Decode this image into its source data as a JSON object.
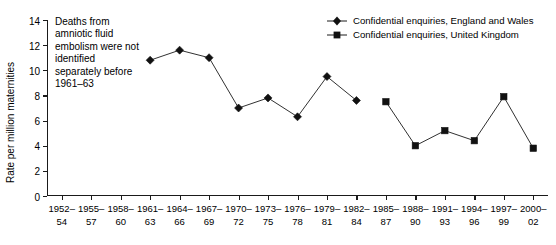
{
  "chart_data": {
    "type": "line",
    "title": "",
    "xlabel": "",
    "ylabel": "Rate per million maternities",
    "ylim": [
      0,
      14
    ],
    "ytick_step": 2,
    "grid": false,
    "legend_position": "top-right",
    "categories": [
      "1952–54",
      "1955–57",
      "1958–60",
      "1961–63",
      "1964–66",
      "1967–69",
      "1970–72",
      "1973–75",
      "1976–78",
      "1979–81",
      "1982–84",
      "1985–87",
      "1988–90",
      "1991–93",
      "1994–96",
      "1997–99",
      "2000–02"
    ],
    "yticks": [
      "0",
      "2",
      "4",
      "6",
      "8",
      "10",
      "12",
      "14"
    ],
    "series": [
      {
        "name": "Confidential enquiries, England and Wales",
        "marker": "diamond",
        "values": [
          null,
          null,
          null,
          10.8,
          11.6,
          11.0,
          7.0,
          7.8,
          6.3,
          9.5,
          7.6,
          null,
          null,
          null,
          null,
          null,
          null
        ]
      },
      {
        "name": "Confidential enquiries, United Kingdom",
        "marker": "square",
        "values": [
          null,
          null,
          null,
          null,
          null,
          null,
          null,
          null,
          null,
          null,
          null,
          7.5,
          4.0,
          5.2,
          4.4,
          7.9,
          3.8
        ]
      }
    ],
    "annotations": [
      {
        "text": "Deaths from\namniotic fluid\nembolism were not\nidentified\nseparately before\n1961–63"
      }
    ],
    "colors": {
      "line": "#1a1a1a",
      "marker": "#111111",
      "axis": "#1a1a1a",
      "background": "#ffffff"
    }
  }
}
